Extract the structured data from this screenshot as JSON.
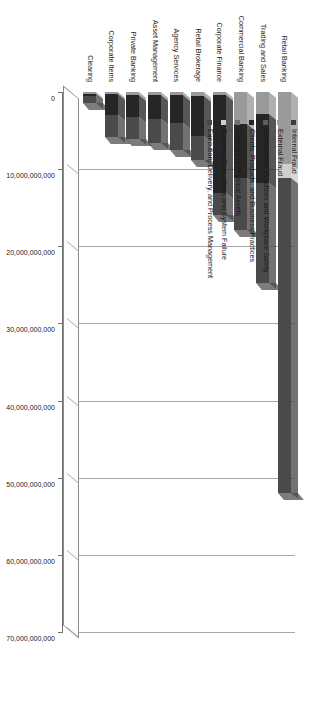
{
  "chart": {
    "type": "bar",
    "orientation": "rotated-horizontal-stacked-3d",
    "title": "",
    "xlabel": "",
    "ylabel": ""
  },
  "axis": {
    "ticks": [
      {
        "value": 0,
        "label": "0"
      },
      {
        "value": 10000000000,
        "label": "10,000,000,000"
      },
      {
        "value": 20000000000,
        "label": "20,000,000,000"
      },
      {
        "value": 30000000000,
        "label": "30,000,000,000"
      },
      {
        "value": 40000000000,
        "label": "40,000,000,000"
      },
      {
        "value": 50000000000,
        "label": "50,000,000,000"
      },
      {
        "value": 60000000000,
        "label": "60,000,000,000"
      },
      {
        "value": 70000000000,
        "label": "70,000,000,000"
      }
    ],
    "min": 0,
    "max": 70000000000
  },
  "legend": {
    "position": "top-left-inside",
    "items": [
      {
        "label": "Internal Fraud",
        "color": "#3b3b3b"
      },
      {
        "label": "External Fraud",
        "color": "#9a9a9a"
      },
      {
        "label": "Employment Practices and Workplace Safety",
        "color": "#5c5c5c"
      },
      {
        "label": "Clients, Products, and Business Practices",
        "color": "#262626"
      },
      {
        "label": "Damage to Physical Assets",
        "color": "#6e6e6e"
      },
      {
        "label": "Business Disruptions and System Failure",
        "color": "#cfcfcf"
      },
      {
        "label": "Execution, Delivery, and Process Management",
        "color": "#4a4a4a"
      }
    ]
  },
  "chart_data": {
    "type": "bar",
    "title": "",
    "xlabel": "",
    "ylabel": "",
    "ylim": [
      0,
      70000000000
    ],
    "grid": true,
    "legend_position": "top-left-inside",
    "stacked": true,
    "categories": [
      "Clearing",
      "Corporate Items",
      "Private Banking",
      "Asset Management",
      "Agency Services",
      "Retail Brokerage",
      "Corporate Finance",
      "Commercial Banking",
      "Trading and Sales",
      "Retail Banking"
    ],
    "series": [
      {
        "name": "Internal Fraud",
        "color": "#3b3b3b",
        "values": [
          0,
          0,
          0,
          0,
          0,
          0,
          0,
          0,
          0,
          0
        ]
      },
      {
        "name": "External Fraud",
        "color": "#9a9a9a",
        "values": [
          200000000,
          300000000,
          400000000,
          400000000,
          400000000,
          500000000,
          400000000,
          4200000000,
          2800000000,
          9300000000
        ]
      },
      {
        "name": "Employment Practices and Workplace Safety",
        "color": "#5c5c5c",
        "values": [
          0,
          0,
          0,
          0,
          0,
          0,
          0,
          0,
          0,
          0
        ]
      },
      {
        "name": "Clients, Products, and Business Practices",
        "color": "#262626",
        "values": [
          300000000,
          2700000000,
          2900000000,
          3100000000,
          3600000000,
          5200000000,
          12700000000,
          7000000000,
          9000000000,
          0
        ]
      },
      {
        "name": "Damage to Physical Assets",
        "color": "#6e6e6e",
        "values": [
          0,
          0,
          0,
          0,
          0,
          0,
          0,
          0,
          0,
          0
        ]
      },
      {
        "name": "Business Disruptions and System Failure",
        "color": "#cfcfcf",
        "values": [
          0,
          0,
          0,
          0,
          0,
          0,
          0,
          0,
          0,
          1900000000
        ]
      },
      {
        "name": "Execution, Delivery, and Process Management",
        "color": "#4a4a4a",
        "values": [
          900000000,
          2800000000,
          2800000000,
          3100000000,
          3500000000,
          3100000000,
          2800000000,
          6700000000,
          12900000000,
          40800000000
        ]
      }
    ],
    "totals": [
      1400000000,
      5800000000,
      6100000000,
      6600000000,
      7500000000,
      8800000000,
      15900000000,
      17900000000,
      24700000000,
      62000000000
    ]
  }
}
